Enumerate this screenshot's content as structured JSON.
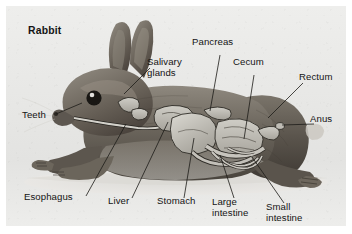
{
  "figure": {
    "title": "Rabbit",
    "panel_background": "#e9e9e7",
    "label_color": "#141414",
    "organ_fill": "#b9b9b4",
    "fur_color": "#6f6a62"
  },
  "labels": [
    {
      "id": "title",
      "text": "Rabbit",
      "x": 28,
      "y": 26,
      "bold": true,
      "lines": 1
    },
    {
      "id": "salivary-glands",
      "text": "Salivary\nglands",
      "x": 147,
      "y": 56,
      "bold": false,
      "lines": 2
    },
    {
      "id": "teeth",
      "text": "Teeth",
      "x": 22,
      "y": 110,
      "bold": false,
      "lines": 1
    },
    {
      "id": "pancreas",
      "text": "Pancreas",
      "x": 192,
      "y": 37,
      "bold": false,
      "lines": 1
    },
    {
      "id": "cecum",
      "text": "Cecum",
      "x": 233,
      "y": 57,
      "bold": false,
      "lines": 1
    },
    {
      "id": "rectum",
      "text": "Rectum",
      "x": 299,
      "y": 72,
      "bold": false,
      "lines": 1
    },
    {
      "id": "anus",
      "text": "Anus",
      "x": 310,
      "y": 114,
      "bold": false,
      "lines": 1
    },
    {
      "id": "esophagus",
      "text": "Esophagus",
      "x": 24,
      "y": 192,
      "bold": false,
      "lines": 1
    },
    {
      "id": "liver",
      "text": "Liver",
      "x": 108,
      "y": 196,
      "bold": false,
      "lines": 1
    },
    {
      "id": "stomach",
      "text": "Stomach",
      "x": 157,
      "y": 196,
      "bold": false,
      "lines": 1
    },
    {
      "id": "large-intestine",
      "text": "Large\nintestine",
      "x": 212,
      "y": 196,
      "bold": false,
      "lines": 2
    },
    {
      "id": "small-intestine",
      "text": "Small\nintestine",
      "x": 266,
      "y": 201,
      "bold": false,
      "lines": 2
    }
  ],
  "leader_lines": [
    {
      "id": "leader-salivary-glands",
      "from": [
        144,
        62
      ],
      "to": [
        118,
        88
      ]
    },
    {
      "id": "leader-teeth",
      "from": [
        50,
        108
      ],
      "to": [
        76,
        97
      ]
    },
    {
      "id": "leader-pancreas",
      "from": [
        214,
        49
      ],
      "to": [
        204,
        105
      ]
    },
    {
      "id": "leader-cecum",
      "from": [
        248,
        69
      ],
      "to": [
        238,
        133
      ]
    },
    {
      "id": "leader-rectum",
      "from": [
        297,
        77
      ],
      "to": [
        262,
        112
      ]
    },
    {
      "id": "leader-anus",
      "from": [
        308,
        118
      ],
      "to": [
        272,
        118
      ]
    },
    {
      "id": "leader-esophagus",
      "from": [
        80,
        190
      ],
      "to": [
        120,
        118
      ]
    },
    {
      "id": "leader-liver",
      "from": [
        126,
        192
      ],
      "to": [
        160,
        115
      ]
    },
    {
      "id": "leader-stomach",
      "from": [
        178,
        192
      ],
      "to": [
        186,
        130
      ]
    },
    {
      "id": "leader-large-intestine",
      "from": [
        228,
        192
      ],
      "to": [
        215,
        148
      ]
    },
    {
      "id": "leader-small-intestine",
      "from": [
        278,
        197
      ],
      "to": [
        247,
        150
      ]
    }
  ]
}
